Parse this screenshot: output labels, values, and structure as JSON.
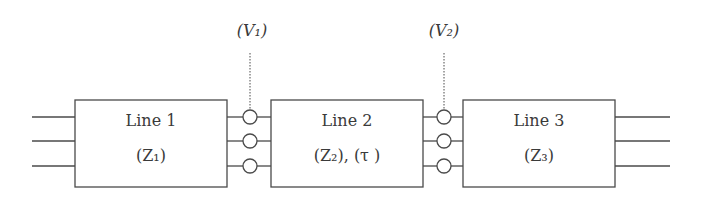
{
  "diagram": {
    "colors": {
      "stroke": "#4a4a4a",
      "text": "#3a3a3a",
      "background": "#ffffff"
    },
    "blocks": [
      {
        "title": "Line 1",
        "param": "(Z₁)"
      },
      {
        "title": "Line 2",
        "param": "(Z₂), (τ )"
      },
      {
        "title": "Line 3",
        "param": "(Z₃)"
      }
    ],
    "nodes": [
      {
        "label": "(V₁)"
      },
      {
        "label": "(V₂)"
      }
    ],
    "conductors_per_line": 3
  }
}
